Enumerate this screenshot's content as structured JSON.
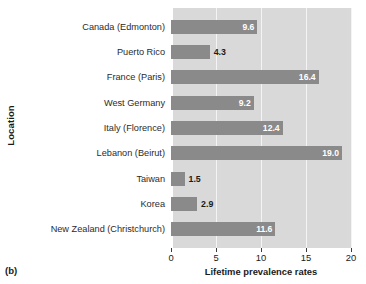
{
  "figure": {
    "panel_label": "(b)"
  },
  "chart_data": {
    "type": "bar",
    "orientation": "horizontal",
    "title": "",
    "xlabel": "Lifetime prevalence rates",
    "ylabel": "Location",
    "categories": [
      "Canada (Edmonton)",
      "Puerto Rico",
      "France (Paris)",
      "West Germany",
      "Italy (Florence)",
      "Lebanon (Beirut)",
      "Taiwan",
      "Korea",
      "New Zealand (Christchurch)"
    ],
    "values": [
      9.6,
      4.3,
      16.4,
      9.2,
      12.4,
      19.0,
      1.5,
      2.9,
      11.6
    ],
    "value_labels": [
      "9.6",
      "4.3",
      "16.4",
      "9.2",
      "12.4",
      "19.0",
      "1.5",
      "2.9",
      "11.6"
    ],
    "label_placement": [
      "inside",
      "outside",
      "inside",
      "inside",
      "inside",
      "inside",
      "outside",
      "outside",
      "inside"
    ],
    "xlim": [
      0,
      20
    ],
    "xticks": [
      0,
      5,
      10,
      15,
      20
    ],
    "xtick_labels": [
      "0",
      "5",
      "10",
      "15",
      "20"
    ],
    "grid": true,
    "legend": null,
    "colors": {
      "bar": "#8a8a8a",
      "plot_background": "#d9d9d9",
      "gridline": "#f4f4f4",
      "value_label_inside": "#ffffff",
      "value_label_outside": "#1a1a1a",
      "text": "#1a1a1a"
    }
  }
}
